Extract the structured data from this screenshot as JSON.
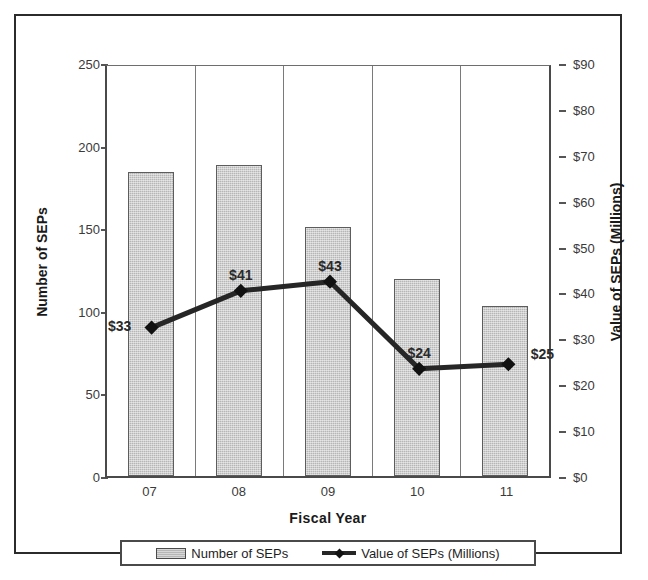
{
  "chart_data": {
    "type": "bar",
    "title": "",
    "subtitle": "",
    "xlabel": "Fiscal Year",
    "categories": [
      "07",
      "08",
      "09",
      "10",
      "11"
    ],
    "grid": false,
    "legend_position": "bottom",
    "axes": {
      "left": {
        "label": "Number of SEPs",
        "ylim": [
          0,
          250
        ],
        "ticks": [
          0,
          50,
          100,
          150,
          200,
          250
        ],
        "tick_labels": [
          "0",
          "50",
          "100",
          "150",
          "200",
          "250"
        ]
      },
      "right": {
        "label": "Value of SEPs (Millions)",
        "ylim": [
          0,
          90
        ],
        "ticks": [
          0,
          10,
          20,
          30,
          40,
          50,
          60,
          70,
          80,
          90
        ],
        "tick_labels": [
          "$0",
          "$10",
          "$20",
          "$30",
          "$40",
          "$50",
          "$60",
          "$70",
          "$80",
          "$90"
        ]
      }
    },
    "series": [
      {
        "name": "Number of SEPs",
        "type": "bar",
        "axis": "left",
        "color": "#b6b6b6",
        "values": [
          184,
          188,
          151,
          119,
          103
        ]
      },
      {
        "name": "Value of SEPs (Millions)",
        "type": "line",
        "axis": "right",
        "color": "#262626",
        "values": [
          33,
          41,
          43,
          24,
          25
        ],
        "point_labels": [
          "$33",
          "$41",
          "$43",
          "$24",
          "$25"
        ]
      }
    ]
  },
  "legend": {
    "items": [
      {
        "label": "Number of SEPs",
        "marker": "bar-swatch"
      },
      {
        "label": "Value of SEPs (Millions)",
        "marker": "line-diamond-swatch"
      }
    ]
  }
}
